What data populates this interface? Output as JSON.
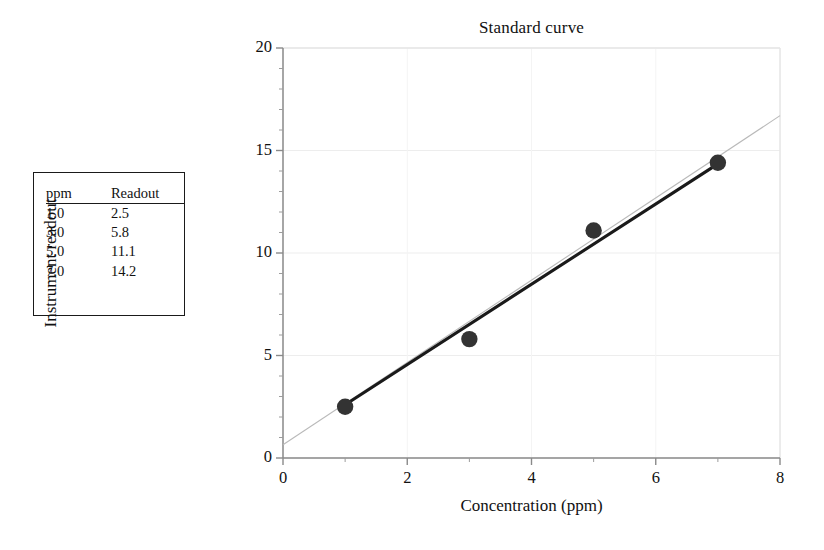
{
  "chart_data": {
    "type": "scatter",
    "title": "Standard curve",
    "xlabel": "Concentration (ppm)",
    "ylabel": "Instrument readout",
    "xlim": [
      0,
      8
    ],
    "ylim": [
      0,
      20
    ],
    "xticks": [
      0,
      2,
      4,
      6,
      8
    ],
    "yticks": [
      0,
      5,
      10,
      15,
      20
    ],
    "xtick_labels": [
      "0",
      "2",
      "4",
      "6",
      "8"
    ],
    "ytick_labels": [
      "0",
      "5",
      "10",
      "15",
      "20"
    ],
    "x_minor_step": 1,
    "y_minor_step": 1,
    "grid": "faint-major-gridlines",
    "legend": "none",
    "series": [
      {
        "name": "Standards",
        "type": "scatter",
        "marker": "filled-circle",
        "color": "#333333",
        "x": [
          1.0,
          3.0,
          5.0,
          7.0
        ],
        "y": [
          2.5,
          5.8,
          11.1,
          14.4
        ]
      },
      {
        "name": "Fit line",
        "type": "line",
        "style": "solid-thick",
        "color": "#1a1a1a",
        "x": [
          1.0,
          7.0
        ],
        "y": [
          2.6,
          14.35
        ]
      },
      {
        "name": "Extrapolated fit",
        "type": "line",
        "style": "thin-light",
        "color": "#b9b9b9",
        "x": [
          0.0,
          8.0
        ],
        "y": [
          0.65,
          16.7
        ]
      }
    ]
  },
  "table": {
    "columns": [
      "ppm",
      "Readout"
    ],
    "rows": [
      [
        "1.0",
        "2.5"
      ],
      [
        "3.0",
        "5.8"
      ],
      [
        "5.0",
        "11.1"
      ],
      [
        "7.0",
        "14.2"
      ]
    ]
  }
}
